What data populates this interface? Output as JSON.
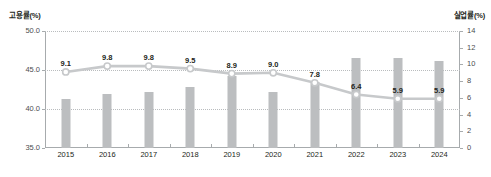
{
  "chart_data": {
    "type": "bar",
    "title": "",
    "subtitle": "",
    "categories": [
      "2015",
      "2016",
      "2017",
      "2018",
      "2019",
      "2020",
      "2021",
      "2022",
      "2023",
      "2024"
    ],
    "xlabel": "",
    "ylabel": "고용률(%)",
    "y2label": "실업률(%)",
    "ylim": [
      35.0,
      50.0
    ],
    "y2lim": [
      0,
      14
    ],
    "grid": true,
    "legend": "none",
    "series": [
      {
        "name": "고용률(%)",
        "type": "bar",
        "axis": "left",
        "color": "#bcbec0",
        "values": [
          41.3,
          41.9,
          42.2,
          42.8,
          44.2,
          42.2,
          43.5,
          46.6,
          46.6,
          46.1
        ],
        "labels": [
          "",
          "",
          "",
          "",
          "",
          "",
          "",
          "",
          "",
          ""
        ]
      },
      {
        "name": "실업률(%)",
        "type": "line",
        "axis": "right",
        "color": "#c7c9cb",
        "marker": "circle-open",
        "values": [
          9.1,
          9.8,
          9.8,
          9.5,
          8.9,
          9.0,
          7.8,
          6.4,
          5.9,
          5.9
        ],
        "labels": [
          "9.1",
          "9.8",
          "9.8",
          "9.5",
          "8.9",
          "9.0",
          "7.8",
          "6.4",
          "5.9",
          "5.9"
        ]
      }
    ],
    "left_axis_ticks": [
      "50.0",
      "45.0",
      "40.0",
      "35.0"
    ],
    "left_axis_tick_values": [
      50.0,
      45.0,
      40.0,
      35.0
    ],
    "right_axis_ticks": [
      "14",
      "12",
      "10",
      "8",
      "6",
      "4",
      "2",
      "0"
    ],
    "right_axis_tick_values": [
      14,
      12,
      10,
      8,
      6,
      4,
      2,
      0
    ]
  }
}
